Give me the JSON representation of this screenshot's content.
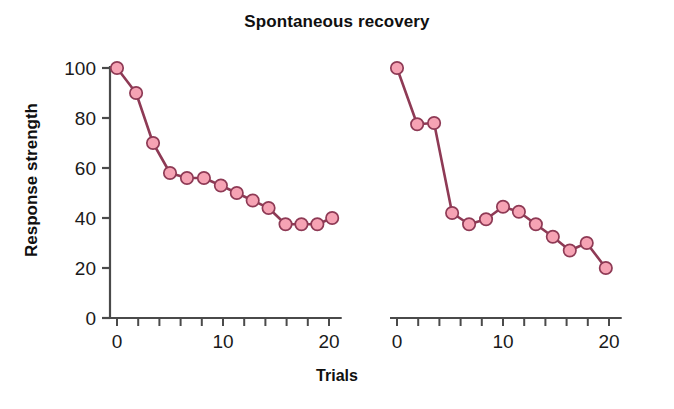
{
  "chart_data": {
    "type": "line",
    "title": "Spontaneous recovery",
    "xlabel": "Trials",
    "ylabel": "Response strength",
    "ylim": [
      0,
      100
    ],
    "xlim": [
      0,
      21
    ],
    "grid": false,
    "legend": null,
    "y_ticks": [
      0,
      20,
      40,
      60,
      80,
      100
    ],
    "y_tick_labels": [
      "0",
      "20",
      "40",
      "60",
      "80",
      "100"
    ],
    "x_ticks": [
      0,
      2,
      4,
      6,
      8,
      10,
      12,
      14,
      16,
      18,
      20
    ],
    "x_tick_labels": [
      "0",
      "",
      "",
      "",
      "",
      "10",
      "",
      "",
      "",
      "",
      "20"
    ],
    "marker_face_color": "#F6A3B4",
    "marker_edge_color": "#8E3A55",
    "line_color": "#8E3A55",
    "axis_color": "#4a4a4a",
    "panels": [
      {
        "name": "acquisition-extinction-panel",
        "x_axis_label_values": [
          "0",
          "10",
          "20"
        ],
        "points": [
          {
            "x": 0,
            "y": 100
          },
          {
            "x": 1.8,
            "y": 90
          },
          {
            "x": 3.4,
            "y": 70
          },
          {
            "x": 5.0,
            "y": 58
          },
          {
            "x": 6.6,
            "y": 56
          },
          {
            "x": 8.2,
            "y": 56
          },
          {
            "x": 9.8,
            "y": 53
          },
          {
            "x": 11.3,
            "y": 50
          },
          {
            "x": 12.8,
            "y": 47
          },
          {
            "x": 14.3,
            "y": 44
          },
          {
            "x": 15.9,
            "y": 37.5
          },
          {
            "x": 17.4,
            "y": 37.5
          },
          {
            "x": 18.9,
            "y": 37.5
          },
          {
            "x": 20.3,
            "y": 40
          }
        ]
      },
      {
        "name": "spontaneous-recovery-panel",
        "x_axis_label_values": [
          "0",
          "10",
          "20"
        ],
        "points": [
          {
            "x": 0,
            "y": 100
          },
          {
            "x": 1.9,
            "y": 77.5
          },
          {
            "x": 3.5,
            "y": 78
          },
          {
            "x": 5.2,
            "y": 42
          },
          {
            "x": 6.8,
            "y": 37.5
          },
          {
            "x": 8.4,
            "y": 39.5
          },
          {
            "x": 10.0,
            "y": 44.5
          },
          {
            "x": 11.5,
            "y": 42.5
          },
          {
            "x": 13.1,
            "y": 37.5
          },
          {
            "x": 14.7,
            "y": 32.5
          },
          {
            "x": 16.3,
            "y": 27
          },
          {
            "x": 17.9,
            "y": 30
          },
          {
            "x": 19.7,
            "y": 20
          }
        ]
      }
    ]
  }
}
